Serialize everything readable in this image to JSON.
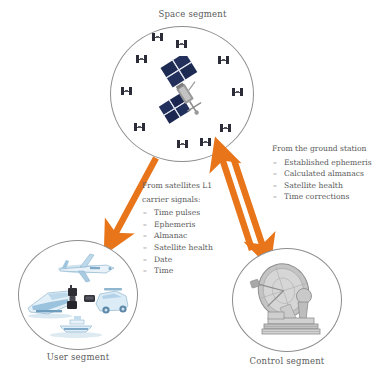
{
  "diagram": {
    "title_note": "GNSS segment interaction diagram",
    "background_color": "#ffffff",
    "arrow_color": "#e8751a",
    "circle_outline_color": "#8e8e8e",
    "text_color": "#5a5a5a",
    "satellite_panel_color": "#2c2c38"
  },
  "segments": {
    "space": {
      "label": "Space segment",
      "satellite_count_small": 10,
      "main_satellite": "gps-satellite"
    },
    "user": {
      "label": "User segment",
      "icons": [
        "airplane",
        "train",
        "car",
        "handheld-receiver",
        "ship"
      ]
    },
    "control": {
      "label": "Control segment",
      "icons": [
        "parabolic-dish-antenna"
      ]
    }
  },
  "downlink": {
    "heading_line1": "From satellites L1",
    "heading_line2": "carrier signals:",
    "bullet": "–",
    "items": [
      "Time pulses",
      "Ephemeris",
      "Almanac",
      "Satellite health",
      "Date",
      "Time"
    ]
  },
  "uplink": {
    "heading": "From the ground station",
    "bullet": "–",
    "items": [
      "Established ephemeris",
      "Calculated almanacs",
      "Satellite health",
      "Time corrections"
    ]
  },
  "arrows": [
    {
      "name": "space-to-user",
      "direction": "down-left",
      "style": "single-head"
    },
    {
      "name": "control-to-space",
      "direction": "up-left",
      "style": "single-head"
    },
    {
      "name": "space-to-control",
      "direction": "down-right",
      "style": "single-head"
    }
  ]
}
